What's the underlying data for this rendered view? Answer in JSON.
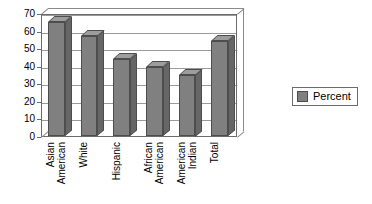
{
  "chart_data": {
    "type": "bar",
    "title": "",
    "subtitle": "",
    "xlabel": "",
    "ylabel": "",
    "categories": [
      "Asian\nAmerican",
      "White",
      "Hispanic",
      "African\nAmerican",
      "American\nIndian",
      "Total"
    ],
    "values": [
      65,
      57,
      44,
      39,
      35,
      54
    ],
    "series": [
      {
        "name": "Percent",
        "values": [
          65,
          57,
          44,
          39,
          35,
          54
        ],
        "color": "#808080"
      }
    ],
    "ylim": [
      0,
      70
    ],
    "ytick_step": 10,
    "yticks": [
      "70",
      "60",
      "50",
      "40",
      "30",
      "20",
      "10",
      "0"
    ],
    "grid": true,
    "legend": {
      "position": "right",
      "entries": [
        {
          "label": "Percent",
          "color": "#808080"
        }
      ]
    },
    "style": {
      "three_d": true,
      "bar_fill": "#808080",
      "bar_top": "#9d9d9d",
      "bar_side": "#666666",
      "bar_outline": "#4d4d4d",
      "gridline_color": "#9a9a9a",
      "axis_color": "#6b6b6b",
      "background": "#ffffff"
    }
  }
}
